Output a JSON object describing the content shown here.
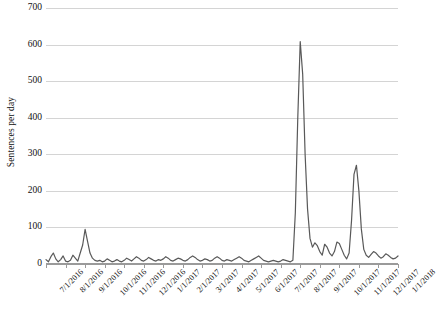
{
  "chart_data": {
    "type": "line",
    "title": "",
    "xlabel": "",
    "ylabel": "Sentences per day",
    "ylim": [
      0,
      700
    ],
    "yticks": [
      0,
      100,
      200,
      300,
      400,
      500,
      600,
      700
    ],
    "ytick_labels": [
      "0",
      "100",
      "200",
      "300",
      "400",
      "500",
      "600",
      "700"
    ],
    "grid": true,
    "legend": false,
    "line_color": "#595959",
    "grid_color": "#d4d4d4",
    "axis_color": "#9a9a9a",
    "xtick_labels": [
      "7/1/2016",
      "8/1/2016",
      "9/1/2016",
      "10/1/2016",
      "11/1/2016",
      "12/1/2016",
      "1/1/2017",
      "2/1/2017",
      "3/1/2017",
      "4/1/2017",
      "5/1/2017",
      "6/1/2017",
      "7/1/2017",
      "8/1/2017",
      "9/1/2017",
      "10/1/2017",
      "11/1/2017",
      "12/1/2017",
      "1/1/2018"
    ],
    "x": [
      0,
      1,
      2,
      3,
      4,
      5,
      6,
      7,
      8,
      9,
      10,
      11,
      12,
      13,
      14,
      15,
      16,
      17,
      18,
      19,
      20,
      21,
      22,
      23,
      24,
      25,
      26,
      27,
      28,
      29,
      30,
      31,
      32,
      33,
      34,
      35,
      36,
      37,
      38,
      39,
      40,
      41,
      42,
      43,
      44,
      45,
      46,
      47,
      48,
      49,
      50,
      51,
      52,
      53,
      54,
      55,
      56,
      57,
      58,
      59,
      60,
      61,
      62,
      63,
      64,
      65,
      66,
      67,
      68,
      69,
      70,
      71,
      72,
      73,
      74,
      75,
      76,
      77,
      78,
      79,
      80,
      81,
      82,
      83,
      84,
      85,
      86,
      87,
      88,
      89,
      90,
      91,
      92,
      93,
      94,
      95,
      96,
      97,
      98,
      99,
      100,
      101,
      102,
      103,
      104,
      105,
      106,
      107,
      108,
      109,
      110,
      111,
      112,
      113,
      114,
      115,
      116,
      117,
      118,
      119,
      120,
      121,
      122,
      123,
      124,
      125,
      126,
      127,
      128,
      129,
      130,
      131,
      132,
      133,
      134,
      135,
      136,
      137,
      138,
      139,
      140,
      141,
      142,
      143,
      144
    ],
    "values": [
      12,
      6,
      20,
      30,
      14,
      6,
      12,
      22,
      8,
      6,
      10,
      24,
      16,
      8,
      30,
      52,
      95,
      62,
      30,
      16,
      10,
      8,
      10,
      6,
      8,
      14,
      10,
      6,
      8,
      12,
      8,
      6,
      10,
      16,
      12,
      8,
      14,
      20,
      16,
      10,
      8,
      12,
      18,
      14,
      10,
      8,
      12,
      10,
      14,
      20,
      16,
      10,
      8,
      12,
      16,
      14,
      10,
      8,
      12,
      18,
      22,
      18,
      12,
      8,
      10,
      14,
      12,
      8,
      10,
      16,
      20,
      16,
      10,
      8,
      12,
      10,
      8,
      12,
      16,
      20,
      16,
      10,
      8,
      6,
      10,
      14,
      18,
      22,
      16,
      10,
      8,
      6,
      8,
      10,
      8,
      6,
      8,
      12,
      10,
      8,
      6,
      10,
      140,
      400,
      608,
      520,
      300,
      150,
      70,
      46,
      58,
      50,
      34,
      24,
      54,
      46,
      30,
      22,
      34,
      60,
      56,
      40,
      24,
      14,
      30,
      120,
      245,
      270,
      200,
      96,
      40,
      24,
      18,
      26,
      34,
      30,
      22,
      16,
      20,
      28,
      24,
      18,
      14,
      16,
      22
    ],
    "annotations": {
      "peak_main": {
        "label": "608",
        "x_approx": "6/1/2017"
      },
      "peak_second": {
        "label": "270",
        "x_approx": "8/1/2017"
      },
      "peak_early": {
        "label": "95",
        "x_approx": "8/1/2016"
      },
      "peak_late": {
        "label": "95",
        "x_approx": "11/1/2017"
      }
    },
    "late_tail": {
      "values": [
        60,
        40,
        28,
        20,
        16,
        22,
        34,
        95,
        60,
        30,
        20,
        16,
        20,
        30,
        36,
        30,
        24,
        20,
        26,
        34,
        28,
        22,
        18,
        24,
        30,
        26,
        20,
        16,
        20,
        26,
        22
      ]
    }
  }
}
